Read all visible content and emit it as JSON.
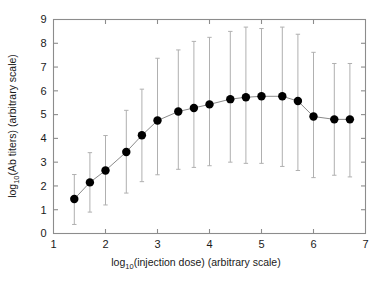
{
  "figure": {
    "background_color": "#ffffff",
    "frame_color": "#8c8c8c",
    "marker_color": "#000000",
    "errorbar_color": "#b0b0b0",
    "line_color": "#8a8a8a"
  },
  "axes": {
    "x_title_main": "log",
    "x_title_sub": "10",
    "x_title_rest": "(injection dose) (arbitrary scale)",
    "y_title_main": "log",
    "y_title_sub": "10",
    "y_title_rest": "(Ab titers) (arbitrary scale)",
    "x_ticks": [
      "1",
      "2",
      "3",
      "4",
      "5",
      "6",
      "7"
    ],
    "y_ticks": [
      "0",
      "1",
      "2",
      "3",
      "4",
      "5",
      "6",
      "7",
      "8",
      "9"
    ]
  },
  "chart_data": {
    "type": "scatter",
    "title": "",
    "xlabel": "log10(injection dose) (arbitrary scale)",
    "ylabel": "log10(Ab titers) (arbitrary scale)",
    "xlim": [
      1,
      7
    ],
    "ylim": [
      0,
      9
    ],
    "grid": false,
    "legend": null,
    "marker": "filled-circle",
    "connected": true,
    "error_bars": "vertical-with-caps",
    "x": [
      1.4,
      1.7,
      2.0,
      2.4,
      2.7,
      3.0,
      3.4,
      3.7,
      4.0,
      4.4,
      4.7,
      5.0,
      5.4,
      5.7,
      6.0,
      6.4,
      6.7
    ],
    "y": [
      1.45,
      2.15,
      2.65,
      3.43,
      4.13,
      4.75,
      5.13,
      5.28,
      5.43,
      5.65,
      5.73,
      5.77,
      5.77,
      5.57,
      4.92,
      4.8,
      4.8
    ],
    "y_err_low": [
      0.38,
      0.9,
      1.2,
      1.7,
      2.18,
      2.47,
      2.7,
      2.78,
      2.85,
      3.0,
      2.95,
      2.95,
      2.82,
      2.65,
      2.35,
      2.45,
      2.38
    ],
    "y_err_high": [
      2.48,
      3.4,
      4.12,
      5.18,
      6.07,
      7.37,
      7.72,
      8.08,
      8.25,
      8.5,
      8.68,
      8.62,
      8.68,
      8.38,
      7.62,
      7.15,
      7.15
    ],
    "series": [
      {
        "name": "Ab titer dose response",
        "values": [
          1.45,
          2.15,
          2.65,
          3.43,
          4.13,
          4.75,
          5.13,
          5.28,
          5.43,
          5.65,
          5.73,
          5.77,
          5.77,
          5.57,
          4.92,
          4.8,
          4.8
        ]
      }
    ]
  }
}
